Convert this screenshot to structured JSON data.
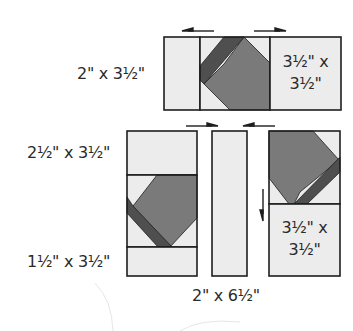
{
  "diagram": {
    "colors": {
      "background": "#ffffff",
      "light_fabric": "#ececec",
      "medium_fabric": "#7a7a7a",
      "dark_fabric": "#4f4f4f",
      "outline": "#1e1e1e",
      "text": "#2a2a2a",
      "faint_arc": "#e4e4e4"
    },
    "top_row": {
      "left_label": "2\" x 3½\"",
      "right_piece_label_line1": "3½\" x",
      "right_piece_label_line2": "3½\"",
      "pressing_arrows": [
        "left",
        "right"
      ]
    },
    "bottom_section": {
      "left_column": {
        "top_label": "2½\" x 3½\"",
        "bottom_label": "1½\" x 3½\""
      },
      "middle_strip": {
        "label": "2\" x 6½\""
      },
      "right_column": {
        "bottom_piece_label_line1": "3½\" x",
        "bottom_piece_label_line2": "3½\""
      },
      "pressing_arrows": [
        "right",
        "left",
        "down"
      ]
    }
  }
}
